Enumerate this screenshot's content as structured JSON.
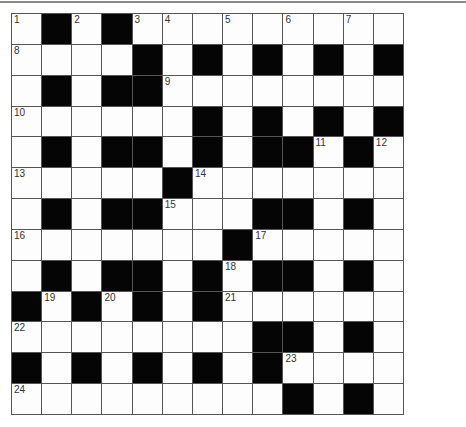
{
  "puzzle": {
    "type": "crossword",
    "rows": 13,
    "cols": 13,
    "grid": [
      "W.W.WWWWWWWWW",
      "WWWW.W.W.W.W.",
      "W.W..WWWWWWWW",
      "WWWWWW.W.W.W.",
      "W.W..W.W..W.W",
      "WWWWW.WWWWWWW",
      "W.W..WWW..W.W",
      "WWWWWWW.WWWWW",
      "W.W..W.W..W.W",
      ".W.W.W.WWWWWW",
      "WWWWWWWW..W.W",
      ".W.W.W.W.WWWW",
      "WWWWWWWWW.W.W"
    ],
    "numbers": [
      {
        "n": "1",
        "r": 0,
        "c": 0
      },
      {
        "n": "2",
        "r": 0,
        "c": 2
      },
      {
        "n": "3",
        "r": 0,
        "c": 4
      },
      {
        "n": "4",
        "r": 0,
        "c": 5
      },
      {
        "n": "5",
        "r": 0,
        "c": 7
      },
      {
        "n": "6",
        "r": 0,
        "c": 9
      },
      {
        "n": "7",
        "r": 0,
        "c": 11
      },
      {
        "n": "8",
        "r": 1,
        "c": 0
      },
      {
        "n": "9",
        "r": 2,
        "c": 5
      },
      {
        "n": "10",
        "r": 3,
        "c": 0
      },
      {
        "n": "11",
        "r": 4,
        "c": 10
      },
      {
        "n": "12",
        "r": 4,
        "c": 12
      },
      {
        "n": "13",
        "r": 5,
        "c": 0
      },
      {
        "n": "14",
        "r": 5,
        "c": 6
      },
      {
        "n": "15",
        "r": 6,
        "c": 5
      },
      {
        "n": "16",
        "r": 7,
        "c": 0
      },
      {
        "n": "17",
        "r": 7,
        "c": 8
      },
      {
        "n": "18",
        "r": 8,
        "c": 7
      },
      {
        "n": "19",
        "r": 9,
        "c": 1
      },
      {
        "n": "20",
        "r": 9,
        "c": 3
      },
      {
        "n": "21",
        "r": 9,
        "c": 7
      },
      {
        "n": "22",
        "r": 10,
        "c": 0
      },
      {
        "n": "23",
        "r": 11,
        "c": 9
      },
      {
        "n": "24",
        "r": 12,
        "c": 0
      }
    ]
  }
}
